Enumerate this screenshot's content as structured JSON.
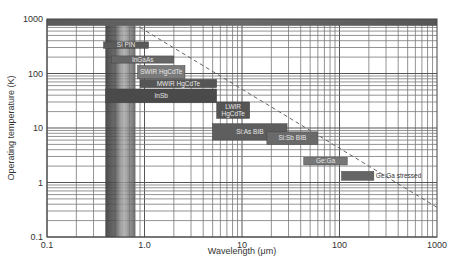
{
  "chart_data": {
    "type": "bar",
    "subtype": "floating-range-log-log",
    "title": "",
    "xlabel": "Wavelength (μm)",
    "ylabel": "Operating temperature (K)",
    "xscale": "log",
    "yscale": "log",
    "xlim": [
      0.1,
      1000
    ],
    "ylim": [
      0.1,
      1000
    ],
    "grid": true,
    "x_ticks": [
      0.1,
      1.0,
      10,
      100,
      1000
    ],
    "x_tick_labels": [
      "0.1",
      "1.0",
      "10",
      "100",
      "1000"
    ],
    "y_ticks": [
      0.1,
      1,
      10,
      100,
      1000
    ],
    "y_tick_labels": [
      "0.1",
      "1",
      "10",
      "100",
      "1000"
    ],
    "visible_band": {
      "label": "visible",
      "range": [
        0.4,
        0.8
      ]
    },
    "top_band": {
      "range": [
        750,
        1000
      ]
    },
    "trend_line": {
      "style": "dashed",
      "from": [
        0.9,
        700
      ],
      "to": [
        1000,
        0.35
      ]
    },
    "series": [
      {
        "name": "Si PIN",
        "x_range": [
          0.38,
          1.1
        ],
        "y_range": [
          290,
          380
        ],
        "label_inside": true
      },
      {
        "name": "InGaAs",
        "x_range": [
          0.46,
          2.0
        ],
        "y_range": [
          155,
          210
        ],
        "label_inside": true
      },
      {
        "name": "SWIR HgCdTe",
        "x_range": [
          0.85,
          2.6
        ],
        "y_range": [
          80,
          140
        ],
        "label_inside": true
      },
      {
        "name": "MWIR HgCdTe",
        "x_range": [
          0.9,
          5.5
        ],
        "y_range": [
          55,
          78
        ],
        "label_inside": true
      },
      {
        "name": "InSb",
        "x_range": [
          0.4,
          5.5
        ],
        "y_range": [
          29,
          52
        ],
        "label_inside": true
      },
      {
        "name": "LWIR HgCdTe",
        "x_range": [
          5.5,
          12
        ],
        "y_range": [
          15,
          30
        ],
        "label_inside": true
      },
      {
        "name": "Si:As BIB",
        "x_range": [
          5.0,
          29
        ],
        "y_range": [
          6,
          12
        ],
        "label_inside": true
      },
      {
        "name": "Si:Sb BIB",
        "x_range": [
          18,
          60
        ],
        "y_range": [
          5,
          8.5
        ],
        "label_inside": true
      },
      {
        "name": "Ge:Ga",
        "x_range": [
          43,
          120
        ],
        "y_range": [
          2.1,
          2.9
        ],
        "label_inside": true
      },
      {
        "name": "Ge:Ga stressed",
        "x_range": [
          105,
          225
        ],
        "y_range": [
          1.1,
          1.6
        ],
        "label_inside": false
      }
    ],
    "bar_colors": {
      "Si PIN": "#5a5a5a",
      "InGaAs": "#666666",
      "SWIR HgCdTe": "#7a7a7a",
      "MWIR HgCdTe": "#555555",
      "InSb": "#4a4a4a",
      "LWIR HgCdTe": "#555555",
      "Si:As BIB": "#5e5e5e",
      "Si:Sb BIB": "#6a6a6a",
      "Ge:Ga": "#777777",
      "Ge:Ga stressed": "#666666"
    }
  }
}
